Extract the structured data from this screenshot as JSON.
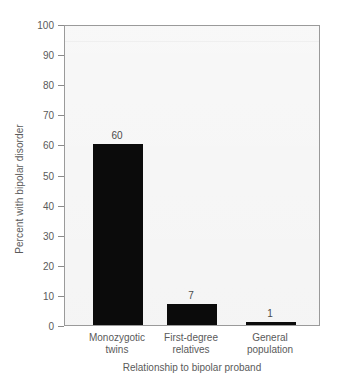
{
  "chart_data": {
    "type": "bar",
    "title": "",
    "categories": [
      "Monozygotic twins",
      "First-degree relatives",
      "General population"
    ],
    "category_lines": [
      [
        "Monozygotic",
        "twins"
      ],
      [
        "First-degree",
        "relatives"
      ],
      [
        "General",
        "population"
      ]
    ],
    "values": [
      60,
      7,
      1
    ],
    "value_labels": [
      "60",
      "7",
      "1"
    ],
    "xlabel": "Relationship to bipolar proband",
    "ylabel": "Percent with bipolar disorder",
    "ylim": [
      0,
      100
    ],
    "yticks": [
      0,
      10,
      20,
      30,
      40,
      50,
      60,
      70,
      80,
      90,
      100
    ],
    "ytick_labels": [
      "0",
      "10",
      "20",
      "30",
      "40",
      "50",
      "60",
      "70",
      "80",
      "90",
      "100"
    ],
    "grid": true,
    "gridlines": [
      95
    ],
    "legend": null,
    "legend_position": "none",
    "bar_color": "#0b0b0b",
    "plot_background": "#efefef",
    "axis_color": "#9a9a9a",
    "text_color": "#5a5a5a"
  }
}
